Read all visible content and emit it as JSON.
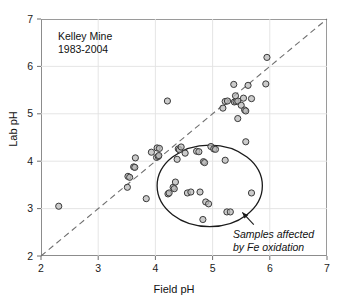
{
  "chart_data": {
    "type": "scatter",
    "title": "Kelley Mine",
    "subtitle": "1983-2004",
    "xlabel": "Field pH",
    "ylabel": "Lab pH",
    "xlim": [
      2,
      7
    ],
    "ylim": [
      2,
      7
    ],
    "xticks": [
      2,
      3,
      4,
      5,
      6,
      7
    ],
    "yticks": [
      2,
      3,
      4,
      5,
      6,
      7
    ],
    "grid": true,
    "legend": "none",
    "reference_line": {
      "name": "one-to-one-line",
      "style": "dashed",
      "from": [
        2,
        2
      ],
      "to": [
        7,
        7
      ]
    },
    "annotations": [
      {
        "name": "fe-oxidation-annotation",
        "line1": "Samples affected",
        "line2": "by Fe oxidation",
        "style": "italic",
        "arrow_from": [
          5.72,
          2.66
        ],
        "arrow_to": [
          5.52,
          2.92
        ]
      }
    ],
    "highlight_region": {
      "name": "fe-oxidation-ellipse",
      "shape": "ellipse",
      "center_x": 4.95,
      "center_y": 3.48,
      "radius_x": 0.92,
      "radius_y": 0.86,
      "rotation_deg": 0
    },
    "series": [
      {
        "name": "samples",
        "marker": "open-circle",
        "marker_fill": "#b9b9b9",
        "marker_edge": "#3a3a3a",
        "points": [
          [
            2.31,
            3.05
          ],
          [
            3.52,
            3.68
          ],
          [
            3.55,
            3.66
          ],
          [
            3.62,
            3.88
          ],
          [
            3.64,
            3.87
          ],
          [
            3.65,
            4.07
          ],
          [
            3.84,
            3.21
          ],
          [
            3.51,
            3.45
          ],
          [
            3.93,
            4.19
          ],
          [
            4.02,
            4.08
          ],
          [
            4.05,
            4.1
          ],
          [
            4.06,
            4.12
          ],
          [
            4.03,
            4.28
          ],
          [
            4.07,
            4.27
          ],
          [
            4.21,
            5.27
          ],
          [
            4.22,
            3.31
          ],
          [
            4.24,
            3.33
          ],
          [
            4.31,
            3.45
          ],
          [
            4.33,
            3.42
          ],
          [
            4.35,
            3.56
          ],
          [
            4.38,
            4.04
          ],
          [
            4.4,
            4.26
          ],
          [
            4.42,
            4.24
          ],
          [
            4.45,
            4.3
          ],
          [
            4.52,
            4.17
          ],
          [
            4.56,
            3.33
          ],
          [
            4.62,
            3.35
          ],
          [
            4.72,
            4.21
          ],
          [
            4.76,
            4.2
          ],
          [
            4.78,
            3.35
          ],
          [
            4.84,
            3.99
          ],
          [
            4.86,
            3.97
          ],
          [
            4.83,
            2.77
          ],
          [
            4.88,
            3.14
          ],
          [
            4.93,
            3.1
          ],
          [
            4.97,
            4.31
          ],
          [
            5.02,
            4.26
          ],
          [
            5.05,
            4.25
          ],
          [
            5.22,
            4.02
          ],
          [
            5.18,
            5.12
          ],
          [
            5.22,
            5.26
          ],
          [
            5.26,
            5.27
          ],
          [
            5.25,
            2.93
          ],
          [
            5.31,
            2.93
          ],
          [
            5.38,
            5.25
          ],
          [
            5.41,
            5.26
          ],
          [
            5.44,
            5.27
          ],
          [
            5.4,
            5.38
          ],
          [
            5.37,
            5.62
          ],
          [
            5.44,
            4.9
          ],
          [
            5.5,
            5.18
          ],
          [
            5.54,
            5.33
          ],
          [
            5.56,
            5.08
          ],
          [
            5.58,
            5.06
          ],
          [
            5.58,
            4.41
          ],
          [
            5.62,
            5.6
          ],
          [
            5.68,
            3.33
          ],
          [
            5.68,
            5.32
          ],
          [
            5.93,
            5.63
          ],
          [
            5.95,
            6.19
          ]
        ]
      }
    ]
  }
}
